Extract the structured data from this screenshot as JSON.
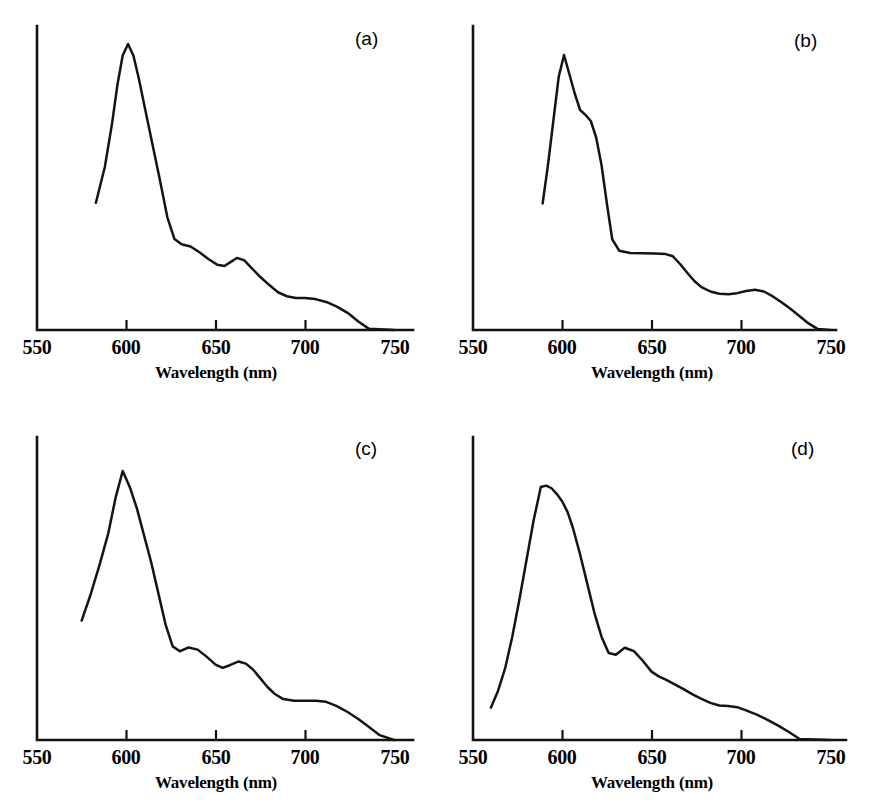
{
  "figure": {
    "kind": "multi-panel-spectra",
    "panel_count": 4,
    "background_color": "#ffffff",
    "curve_color": "#141414",
    "axis_color": "#111111"
  },
  "axis": {
    "xlabel": "Wavelength (nm)",
    "tick_labels": [
      "550",
      "600",
      "650",
      "700",
      "750"
    ],
    "tick_values": [
      550,
      600,
      650,
      700,
      750
    ],
    "xmin": 550,
    "xmax": 750,
    "ylabel": ""
  },
  "panels": [
    {
      "id": "a",
      "label": "(a)"
    },
    {
      "id": "b",
      "label": "(b)"
    },
    {
      "id": "c",
      "label": "(c)"
    },
    {
      "id": "d",
      "label": "(d)"
    }
  ],
  "chart_data": [
    {
      "type": "line",
      "panel": "(a)",
      "title": "",
      "xlabel": "Wavelength (nm)",
      "ylabel": "",
      "xlim": [
        550,
        750
      ],
      "ylim": [
        0,
        1
      ],
      "xticks": [
        550,
        600,
        650,
        700,
        750
      ],
      "grid": false,
      "legend": false,
      "peaks_nm": [
        601,
        661,
        697
      ],
      "shoulders_nm": [
        628
      ],
      "x": [
        583,
        588,
        592,
        595,
        598,
        601,
        604,
        607,
        611,
        615,
        619,
        623,
        627,
        631,
        636,
        641,
        646,
        651,
        655,
        659,
        662,
        666,
        670,
        675,
        680,
        685,
        690,
        695,
        700,
        706,
        712,
        718,
        724,
        730,
        736,
        750
      ],
      "y": [
        0.445,
        0.57,
        0.72,
        0.855,
        0.96,
        1.0,
        0.96,
        0.88,
        0.76,
        0.64,
        0.52,
        0.395,
        0.318,
        0.3,
        0.292,
        0.272,
        0.248,
        0.228,
        0.224,
        0.24,
        0.252,
        0.244,
        0.218,
        0.186,
        0.158,
        0.132,
        0.118,
        0.112,
        0.112,
        0.108,
        0.098,
        0.082,
        0.06,
        0.03,
        0.004,
        0.0
      ]
    },
    {
      "type": "line",
      "panel": "(b)",
      "title": "",
      "xlabel": "Wavelength (nm)",
      "ylabel": "",
      "xlim": [
        550,
        750
      ],
      "ylim": [
        0,
        1
      ],
      "xticks": [
        550,
        600,
        650,
        700,
        750
      ],
      "grid": false,
      "legend": false,
      "peaks_nm": [
        601,
        710
      ],
      "shoulders_nm": [
        612,
        640
      ],
      "x": [
        589,
        592,
        595,
        598,
        601,
        604,
        607,
        610,
        613,
        616,
        619,
        622,
        625,
        628,
        632,
        638,
        645,
        652,
        658,
        662,
        666,
        670,
        674,
        678,
        683,
        688,
        693,
        698,
        703,
        708,
        713,
        718,
        723,
        728,
        733,
        738,
        743,
        750
      ],
      "y": [
        0.46,
        0.6,
        0.76,
        0.92,
        1.0,
        0.93,
        0.86,
        0.8,
        0.782,
        0.76,
        0.7,
        0.6,
        0.46,
        0.33,
        0.288,
        0.28,
        0.279,
        0.278,
        0.276,
        0.268,
        0.24,
        0.208,
        0.178,
        0.156,
        0.14,
        0.132,
        0.13,
        0.134,
        0.142,
        0.146,
        0.14,
        0.122,
        0.1,
        0.076,
        0.05,
        0.024,
        0.004,
        0.0
      ]
    },
    {
      "type": "line",
      "panel": "(c)",
      "title": "",
      "xlabel": "Wavelength (nm)",
      "ylabel": "",
      "xlim": [
        550,
        750
      ],
      "ylim": [
        0,
        1
      ],
      "xticks": [
        550,
        600,
        650,
        700,
        750
      ],
      "grid": false,
      "legend": false,
      "peaks_nm": [
        598,
        635,
        663
      ],
      "shoulders_nm": [
        700
      ],
      "x": [
        575,
        580,
        585,
        590,
        594,
        598,
        602,
        606,
        610,
        614,
        618,
        622,
        626,
        630,
        635,
        640,
        645,
        650,
        654,
        658,
        663,
        667,
        671,
        675,
        679,
        683,
        688,
        694,
        700,
        706,
        712,
        718,
        724,
        730,
        736,
        742,
        750
      ],
      "y": [
        0.444,
        0.54,
        0.65,
        0.77,
        0.9,
        1.0,
        0.94,
        0.86,
        0.76,
        0.66,
        0.545,
        0.43,
        0.348,
        0.33,
        0.344,
        0.336,
        0.31,
        0.28,
        0.268,
        0.278,
        0.292,
        0.284,
        0.262,
        0.23,
        0.198,
        0.172,
        0.152,
        0.146,
        0.146,
        0.146,
        0.142,
        0.126,
        0.104,
        0.078,
        0.048,
        0.018,
        0.0
      ]
    },
    {
      "type": "line",
      "panel": "(d)",
      "title": "",
      "xlabel": "Wavelength (nm)",
      "ylabel": "",
      "xlim": [
        550,
        750
      ],
      "ylim": [
        0,
        1
      ],
      "xticks": [
        550,
        600,
        650,
        700,
        750
      ],
      "grid": false,
      "legend": false,
      "peaks_nm": [
        588,
        635
      ],
      "shoulders_nm": [
        595,
        650,
        693
      ],
      "x": [
        560,
        564,
        568,
        572,
        576,
        580,
        584,
        588,
        591,
        594,
        597,
        600,
        603,
        606,
        610,
        614,
        618,
        622,
        626,
        630,
        635,
        640,
        645,
        650,
        654,
        658,
        663,
        668,
        673,
        678,
        683,
        688,
        693,
        698,
        703,
        709,
        715,
        721,
        727,
        733,
        750
      ],
      "y": [
        0.122,
        0.185,
        0.27,
        0.39,
        0.53,
        0.68,
        0.83,
        0.955,
        0.96,
        0.95,
        0.928,
        0.9,
        0.86,
        0.8,
        0.7,
        0.59,
        0.48,
        0.39,
        0.328,
        0.322,
        0.348,
        0.336,
        0.3,
        0.258,
        0.24,
        0.228,
        0.21,
        0.192,
        0.172,
        0.155,
        0.14,
        0.13,
        0.128,
        0.124,
        0.112,
        0.096,
        0.076,
        0.054,
        0.03,
        0.004,
        0.0
      ]
    }
  ]
}
